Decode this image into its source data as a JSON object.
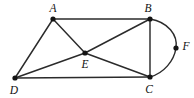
{
  "figure": {
    "kind": "undirected-graph-diagram",
    "background_color": "#ffffff",
    "stroke_color": "#2b2b2b",
    "vertex_color": "#141414",
    "label_color": "#111111",
    "width": 194,
    "height": 98
  },
  "vertices": [
    {
      "id": "A",
      "label": "A",
      "x": 53,
      "y": 19,
      "r": 2.6,
      "label_x": 53,
      "label_y": 12,
      "degree": 3
    },
    {
      "id": "B",
      "label": "B",
      "x": 150,
      "y": 19,
      "r": 2.6,
      "label_x": 148,
      "label_y": 12,
      "degree": 4
    },
    {
      "id": "C",
      "label": "C",
      "x": 150,
      "y": 77,
      "r": 2.6,
      "label_x": 149,
      "label_y": 93,
      "degree": 4
    },
    {
      "id": "D",
      "label": "D",
      "x": 15,
      "y": 78,
      "r": 2.6,
      "label_x": 14,
      "label_y": 94,
      "degree": 3
    },
    {
      "id": "E",
      "label": "E",
      "x": 85,
      "y": 53,
      "r": 2.6,
      "label_x": 85,
      "label_y": 68,
      "degree": 4
    },
    {
      "id": "F",
      "label": "F",
      "x": 176,
      "y": 48,
      "r": 2.6,
      "label_x": 186,
      "label_y": 50,
      "degree": 2
    }
  ],
  "edges": [
    {
      "id": "AB",
      "from": "A",
      "to": "B",
      "shape": "straight",
      "path": "M 53 19 L 150 19"
    },
    {
      "id": "AD",
      "from": "A",
      "to": "D",
      "shape": "straight",
      "path": "M 53 19 L 15 78"
    },
    {
      "id": "AE",
      "from": "A",
      "to": "E",
      "shape": "straight",
      "path": "M 53 19 L 85 53"
    },
    {
      "id": "BC",
      "from": "B",
      "to": "C",
      "shape": "straight",
      "path": "M 150 19 L 150 77"
    },
    {
      "id": "BE",
      "from": "B",
      "to": "E",
      "shape": "straight",
      "path": "M 150 19 L 85 53"
    },
    {
      "id": "CD",
      "from": "C",
      "to": "D",
      "shape": "straight",
      "path": "M 150 77 L 15 78"
    },
    {
      "id": "CE",
      "from": "C",
      "to": "E",
      "shape": "straight",
      "path": "M 150 77 L 85 53"
    },
    {
      "id": "DE",
      "from": "D",
      "to": "E",
      "shape": "straight",
      "path": "M 15 78 L 85 53"
    },
    {
      "id": "BFC",
      "from": "B",
      "to": "C",
      "via": "F",
      "shape": "arc",
      "path": "M 150 19 C 168 22 178 35 176 48 C 174 61 164 73 150 77"
    }
  ]
}
